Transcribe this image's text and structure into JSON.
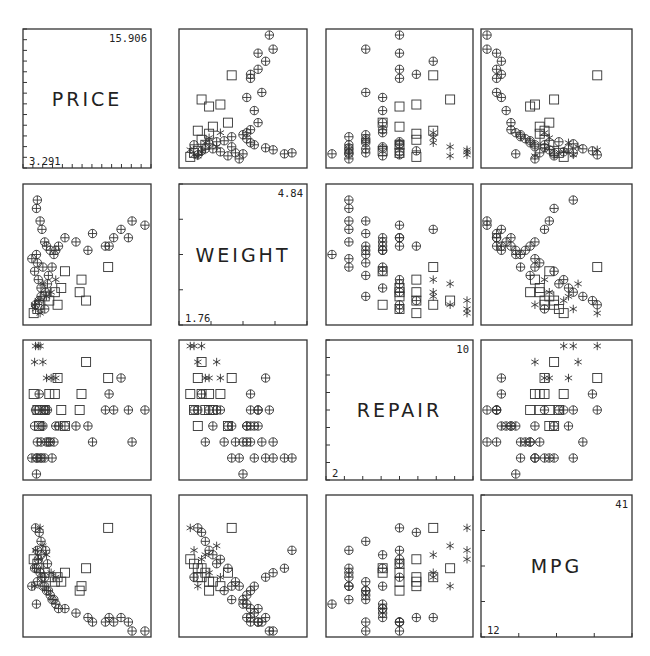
{
  "chart_data": {
    "type": "scatter",
    "variables": [
      {
        "name": "PRICE",
        "min": "3.291",
        "max": "15.906",
        "ticks": 13
      },
      {
        "name": "WEIGHT",
        "min": "1.76",
        "max": "4.84",
        "ticks": 4
      },
      {
        "name": "REPAIR",
        "min": "2",
        "max": "10",
        "ticks": 8
      },
      {
        "name": "MPG",
        "min": "12",
        "max": "41",
        "ticks": 4
      }
    ],
    "legend": {
      "markers": [
        {
          "symbol": "circle-plus",
          "group": "group 1"
        },
        {
          "symbol": "square",
          "group": "group 2"
        },
        {
          "symbol": "asterisk",
          "group": "group 3"
        }
      ]
    },
    "layout": {
      "grid": false,
      "legend_position": "none",
      "matrix_size": 4
    },
    "series": [
      {
        "name": "circle-plus",
        "points": [
          [
            4.2,
            4.6,
            3,
            30
          ],
          [
            4.1,
            4.4,
            3,
            26
          ],
          [
            4.5,
            4.1,
            3,
            25
          ],
          [
            4.7,
            3.9,
            3,
            24
          ],
          [
            5.0,
            3.6,
            3,
            22
          ],
          [
            5.2,
            3.5,
            4,
            21
          ],
          [
            5.6,
            3.4,
            4,
            20
          ],
          [
            6.0,
            3.3,
            4,
            19
          ],
          [
            6.2,
            3.4,
            5,
            18
          ],
          [
            6.5,
            3.5,
            5,
            17
          ],
          [
            7.2,
            3.7,
            5,
            17
          ],
          [
            8.4,
            3.6,
            5,
            16
          ],
          [
            9.7,
            3.4,
            5,
            15
          ],
          [
            10.2,
            3.8,
            4,
            14
          ],
          [
            11.6,
            3.5,
            6,
            14
          ],
          [
            12.0,
            3.5,
            7,
            15
          ],
          [
            12.5,
            3.7,
            6,
            14
          ],
          [
            13.3,
            3.9,
            8,
            15
          ],
          [
            14.1,
            3.7,
            6,
            14
          ],
          [
            14.5,
            4.1,
            4,
            12
          ],
          [
            15.9,
            4.0,
            6,
            12
          ],
          [
            3.9,
            2.9,
            5,
            26
          ],
          [
            4.3,
            2.7,
            6,
            28
          ],
          [
            4.6,
            2.5,
            5,
            29
          ],
          [
            5.1,
            2.4,
            6,
            30
          ],
          [
            4.2,
            3.1,
            4,
            23
          ],
          [
            4.8,
            3.0,
            5,
            22
          ],
          [
            5.4,
            2.8,
            4,
            21
          ],
          [
            4.4,
            2.2,
            7,
            34
          ],
          [
            4.0,
            2.1,
            6,
            35
          ],
          [
            4.6,
            2.3,
            4,
            32
          ],
          [
            5.0,
            2.0,
            6,
            24
          ],
          [
            5.3,
            2.6,
            6,
            27
          ],
          [
            5.8,
            3.0,
            3,
            19
          ],
          [
            3.6,
            3.2,
            3,
            22
          ],
          [
            4.1,
            3.3,
            2,
            18
          ]
        ]
      },
      {
        "name": "square",
        "points": [
          [
            3.8,
            1.9,
            7,
            28
          ],
          [
            4.2,
            2.0,
            6,
            27
          ],
          [
            4.4,
            2.1,
            5,
            26
          ],
          [
            5.0,
            2.3,
            6,
            25
          ],
          [
            5.5,
            2.2,
            7,
            24
          ],
          [
            6.1,
            2.4,
            7,
            23
          ],
          [
            6.8,
            2.5,
            6,
            23
          ],
          [
            7.2,
            2.9,
            5,
            25
          ],
          [
            8.8,
            2.4,
            6,
            21
          ],
          [
            9.0,
            2.7,
            7,
            22
          ],
          [
            11.9,
            3.0,
            8,
            35
          ],
          [
            9.5,
            2.2,
            9,
            26
          ],
          [
            6.4,
            2.1,
            8,
            24
          ]
        ]
      },
      {
        "name": "asterisk",
        "points": [
          [
            4.0,
            2.0,
            10,
            30
          ],
          [
            4.3,
            2.2,
            10,
            28
          ],
          [
            4.8,
            2.6,
            9,
            31
          ],
          [
            5.7,
            2.4,
            8,
            25
          ],
          [
            6.2,
            2.7,
            8,
            24
          ],
          [
            4.5,
            1.9,
            10,
            35
          ],
          [
            3.9,
            2.1,
            9,
            22
          ],
          [
            5.2,
            2.3,
            8,
            29
          ]
        ]
      }
    ]
  }
}
